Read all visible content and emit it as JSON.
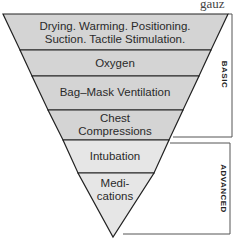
{
  "cut_text": "gauz",
  "diagram": {
    "type": "inverted-pyramid",
    "colors": {
      "band_fill": "#d4d4d4",
      "advanced_fill": "#e6e6e6",
      "stroke": "#222222"
    },
    "levels": [
      {
        "label_line1": "Drying. Warming. Positioning.",
        "label_line2": "Suction. Tactile Stimulation.",
        "group": "basic"
      },
      {
        "label_line1": "Oxygen",
        "group": "basic"
      },
      {
        "label_line1": "Bag–Mask Ventilation",
        "group": "basic"
      },
      {
        "label_line1": "Chest",
        "label_line2": "Compressions",
        "group": "basic"
      },
      {
        "label_line1": "Intubation",
        "group": "advanced"
      },
      {
        "label_line1": "Medi-",
        "label_line2": "cations",
        "group": "advanced"
      }
    ],
    "groups": {
      "basic": "BASIC",
      "advanced": "ADVANCED"
    }
  }
}
